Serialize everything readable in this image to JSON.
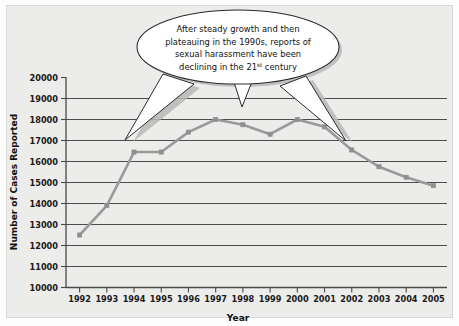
{
  "figure": {
    "background_color": "#ececea",
    "frame_color": "#d8d8d6"
  },
  "annotation": {
    "name": "callout-bubble",
    "lines": [
      "After steady growth and then",
      "plateauing in the 1990s, reports of",
      "sexual harassment have been",
      "declining in the 21"
    ],
    "line4_suffix": "st",
    "line4_tail": " century",
    "full_text": "After steady growth and then plateauing in the 1990s, reports of sexual harassment have been declining in the 21st century",
    "pointers": 3,
    "fill_color": "#ffffff",
    "border_color": "#2a2a2a"
  },
  "chart_data": {
    "type": "line",
    "title": "",
    "xlabel": "Year",
    "ylabel": "Number of Cases Reported",
    "categories": [
      "1992",
      "1993",
      "1994",
      "1995",
      "1996",
      "1997",
      "1998",
      "1999",
      "2000",
      "2001",
      "2002",
      "2003",
      "2004",
      "2005"
    ],
    "x": [
      1992,
      1993,
      1994,
      1995,
      1996,
      1997,
      1998,
      1999,
      2000,
      2001,
      2002,
      2003,
      2004,
      2005
    ],
    "values": [
      12500,
      13900,
      16450,
      16450,
      17400,
      18000,
      17750,
      17300,
      18000,
      17650,
      16550,
      15750,
      15250,
      14850
    ],
    "series": [
      {
        "name": "Number of Cases Reported",
        "color": "#9a9a9a",
        "marker": "square",
        "values": [
          12500,
          13900,
          16450,
          16450,
          17400,
          18000,
          17750,
          17300,
          18000,
          17650,
          16550,
          15750,
          15250,
          14850
        ]
      }
    ],
    "ylim": [
      10000,
      20000
    ],
    "yticks": [
      10000,
      11000,
      12000,
      13000,
      14000,
      15000,
      16000,
      17000,
      18000,
      19000,
      20000
    ],
    "ytick_labels": [
      "10000",
      "11000",
      "12000",
      "13000",
      "14000",
      "15000",
      "16000",
      "17000",
      "18000",
      "19000",
      "20000"
    ],
    "xlim": [
      1991.5,
      2005.5
    ],
    "grid": true,
    "grid_axis": "y",
    "legend": false,
    "legend_position": "none"
  }
}
